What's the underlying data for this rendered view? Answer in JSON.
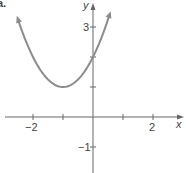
{
  "chart_data": {
    "type": "line",
    "title": "",
    "panel_label": "a.",
    "xlabel": "x",
    "ylabel": "y",
    "xlim": [
      -2.6,
      2.9
    ],
    "ylim": [
      -1.85,
      3.9
    ],
    "x_ticks": [
      -2,
      -1,
      1,
      2
    ],
    "x_tick_labels": [
      "-2",
      "2"
    ],
    "y_ticks": [
      3,
      2,
      1,
      -1
    ],
    "y_tick_labels": [
      "3",
      "-1"
    ],
    "grid": false,
    "series": [
      {
        "name": "y = x^2 + 2x + 2",
        "equation": "y = (x + 1)^2 + 1",
        "vertex": [
          -1,
          1
        ],
        "y_intercept": 2,
        "x_range": [
          -2.5,
          0.55
        ],
        "arrows_both_ends": true,
        "color": "#8c8c8c",
        "points": [
          {
            "x": -2.5,
            "y": 3.25
          },
          {
            "x": -2,
            "y": 2
          },
          {
            "x": -1.5,
            "y": 1.25
          },
          {
            "x": -1,
            "y": 1
          },
          {
            "x": -0.5,
            "y": 1.25
          },
          {
            "x": 0,
            "y": 2
          },
          {
            "x": 0.5,
            "y": 3.25
          }
        ]
      }
    ]
  },
  "labels": {
    "panel": "a.",
    "x_axis": "x",
    "y_axis": "y",
    "x_neg2": "−2",
    "x_pos2": "2",
    "y_pos3": "3",
    "y_neg1": "−1"
  },
  "colors": {
    "axis": "#666666",
    "curve": "#8c8c8c",
    "text": "#444444"
  }
}
